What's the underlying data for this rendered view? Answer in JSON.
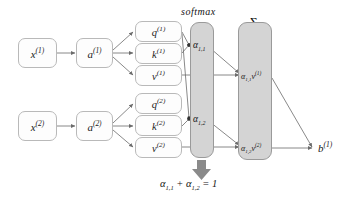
{
  "diagram": {
    "colors": {
      "background": "#ffffff",
      "box_fill": "#fdfdfd",
      "box_stroke": "#b9b9b9",
      "column_fill": "#d4d4d4",
      "column_stroke": "#9a9a9a",
      "arrow": "#6b6b6b",
      "text": "#141414",
      "big_arrow": "#8a8a8a"
    }
  },
  "inputs": [
    {
      "id": "x1",
      "base": "x",
      "sup": "(1)"
    },
    {
      "id": "x2",
      "base": "x",
      "sup": "(2)"
    }
  ],
  "embeddings": [
    {
      "id": "a1",
      "base": "a",
      "sup": "(1)"
    },
    {
      "id": "a2",
      "base": "a",
      "sup": "(2)"
    }
  ],
  "projections": [
    {
      "id": "q1",
      "base": "q",
      "sup": "(1)"
    },
    {
      "id": "k1",
      "base": "k",
      "sup": "(1)"
    },
    {
      "id": "v1",
      "base": "v",
      "sup": "(1)"
    },
    {
      "id": "q2",
      "base": "q",
      "sup": "(2)"
    },
    {
      "id": "k2",
      "base": "k",
      "sup": "(2)"
    },
    {
      "id": "v2",
      "base": "v",
      "sup": "(2)"
    }
  ],
  "softmax_column": {
    "caption": "softmax",
    "entries": [
      {
        "id": "alpha11",
        "base": "α",
        "sub": "1,1"
      },
      {
        "id": "alpha12",
        "base": "α",
        "sub": "1,2"
      }
    ]
  },
  "sum_column": {
    "caption": "Σ",
    "entries": [
      {
        "id": "a11v1",
        "base": "α",
        "sub": "1,1",
        "tail_base": "v",
        "tail_sup": "(1)"
      },
      {
        "id": "a12v2",
        "base": "α",
        "sub": "1,2",
        "tail_base": "v",
        "tail_sup": "(2)"
      }
    ]
  },
  "output": {
    "id": "b1",
    "base": "b",
    "sup": "(1)"
  },
  "constraint": {
    "text_parts": {
      "alpha": "α",
      "sub_a": "1,1",
      "plus": "+",
      "sub_b": "1,2",
      "equals": "= 1"
    },
    "full_text": "α₁,₁ + α₁,₂ = 1"
  }
}
